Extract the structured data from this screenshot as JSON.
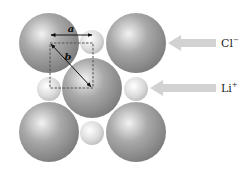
{
  "diagram": {
    "labels": {
      "anion": "Cl",
      "anion_charge": "−",
      "cation": "Li",
      "cation_charge": "+",
      "edge_length": "a",
      "diagonal": "b"
    },
    "colors": {
      "large_sphere": "#8f8f8f",
      "small_sphere": "#d4d4d4",
      "pointer_arrow": "#d2d2d2",
      "dimension_line": "#111111",
      "dashed_box": "#555555"
    },
    "large_spheres": [
      {
        "cx": 49,
        "cy": 43,
        "r": 30
      },
      {
        "cx": 136,
        "cy": 43,
        "r": 30
      },
      {
        "cx": 92,
        "cy": 88,
        "r": 30
      },
      {
        "cx": 49,
        "cy": 132,
        "r": 30
      },
      {
        "cx": 136,
        "cy": 132,
        "r": 30
      }
    ],
    "small_spheres": [
      {
        "cx": 92,
        "cy": 42,
        "r": 12
      },
      {
        "cx": 49,
        "cy": 89,
        "r": 12
      },
      {
        "cx": 136,
        "cy": 89,
        "r": 12
      },
      {
        "cx": 92,
        "cy": 133,
        "r": 12
      }
    ]
  }
}
